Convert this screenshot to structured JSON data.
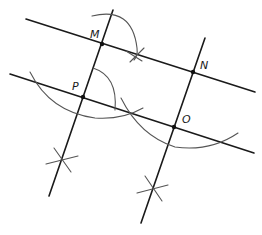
{
  "diagram": {
    "type": "geometric-construction",
    "points": [
      {
        "name": "M",
        "x": 102,
        "y": 44,
        "label_x": 90,
        "label_y": 38
      },
      {
        "name": "N",
        "x": 193,
        "y": 72,
        "label_x": 200,
        "label_y": 69
      },
      {
        "name": "P",
        "x": 83,
        "y": 97,
        "label_x": 72,
        "label_y": 90
      },
      {
        "name": "O",
        "x": 174,
        "y": 127,
        "label_x": 182,
        "label_y": 123
      }
    ],
    "labels": {
      "M": "M",
      "N": "N",
      "P": "P",
      "O": "O"
    },
    "colors": {
      "line": "#1a1a1a",
      "arc": "#555555",
      "background": "#ffffff"
    }
  }
}
